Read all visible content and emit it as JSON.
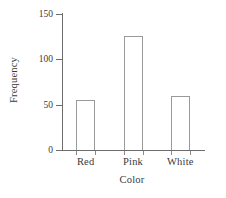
{
  "chart_data": {
    "type": "bar",
    "title": "",
    "categories": [
      "Red",
      "Pink",
      "White"
    ],
    "values": [
      55,
      126,
      60
    ],
    "xlabel": "Color",
    "ylabel": "Frequency",
    "ylim": [
      0,
      150
    ],
    "yticks": [
      0,
      50,
      100,
      150
    ],
    "ytick_labels": [
      "0",
      "50",
      "100",
      "150"
    ],
    "grid": false,
    "legend": null,
    "bar_fill": "#ffffff",
    "bar_edge_color": "#9a9a9a",
    "axis_color": "#6d6d6d",
    "text_color": "#3a3a3a",
    "background": "#ffffff"
  },
  "axes": {
    "y_title": "Frequency",
    "x_title": "Color"
  },
  "y_ticks": [
    {
      "label": "150",
      "value": 150
    },
    {
      "label": "100",
      "value": 100
    },
    {
      "label": "50",
      "value": 50
    },
    {
      "label": "0",
      "value": 0
    }
  ],
  "bars": [
    {
      "label": "Red",
      "value": 55
    },
    {
      "label": "Pink",
      "value": 126
    },
    {
      "label": "White",
      "value": 60
    }
  ]
}
